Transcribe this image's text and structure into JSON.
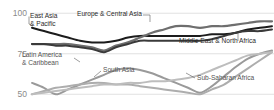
{
  "chart_data": {
    "type": "line",
    "title": "",
    "subtitle": "",
    "xlabel": "",
    "ylabel": "",
    "ylim": [
      44,
      102
    ],
    "yticks": [
      100,
      75,
      50
    ],
    "ytick_labels": [
      "100",
      "75",
      "50"
    ],
    "grid": true,
    "grid_axis": "y",
    "legend": "inline-callouts",
    "x": [
      0,
      1,
      2,
      3,
      4,
      5,
      6,
      7,
      8,
      9,
      10,
      11,
      12,
      13,
      14,
      15,
      16,
      17,
      18,
      19,
      20
    ],
    "series": [
      {
        "name": "East Asia & Pacific",
        "color": "#1c1c1c",
        "width": 2.0,
        "values": [
          91,
          89,
          87,
          85,
          83,
          82,
          82,
          83,
          85,
          86,
          86,
          86,
          86,
          86,
          86,
          87,
          87,
          88,
          90,
          91,
          92
        ]
      },
      {
        "name": "Europe & Central Asia",
        "color": "#6e6e6e",
        "width": 2.2,
        "values": [
          81,
          81,
          81,
          81,
          80,
          79,
          77,
          80,
          82,
          85,
          88,
          90,
          92,
          92,
          91,
          92,
          92,
          93,
          94,
          95,
          95
        ]
      },
      {
        "name": "Middle East & North Africa",
        "color": "#3a3a3a",
        "width": 2.0,
        "values": [
          81,
          81,
          80,
          80,
          79,
          78,
          76,
          79,
          81,
          83,
          83,
          83,
          83,
          83,
          83,
          84,
          86,
          88,
          89,
          89,
          90
        ]
      },
      {
        "name": "Latin America & Caribbean",
        "color": "#9a9a9a",
        "width": 2.0,
        "values": [
          57,
          54,
          50,
          53,
          56,
          59,
          62,
          65,
          66,
          65,
          63,
          60,
          57,
          54,
          51,
          55,
          61,
          67,
          72,
          75,
          77
        ]
      },
      {
        "name": "South Asia",
        "color": "#adadad",
        "width": 2.0,
        "values": [
          50,
          52,
          54,
          55,
          56,
          57,
          57,
          56,
          56,
          55,
          54,
          53,
          52,
          51,
          50,
          53,
          56,
          61,
          66,
          71,
          76
        ]
      },
      {
        "name": "Sub-Saharan Africa",
        "color": "#bdbdbd",
        "width": 2.0,
        "values": [
          50,
          51,
          52,
          53,
          54,
          55,
          56,
          56,
          57,
          57,
          58,
          58,
          59,
          60,
          62,
          65,
          68,
          71,
          74,
          75,
          76
        ]
      }
    ],
    "callouts": [
      {
        "label": "East Asia",
        "label2": "& Pacific",
        "x": 30,
        "y": 18
      },
      {
        "label": "Europe & Central Asia",
        "label2": "",
        "x": 77,
        "y": 16
      },
      {
        "label": "Middle East & North Africa",
        "label2": "",
        "x": 179,
        "y": 43
      },
      {
        "label": "Latin America",
        "label2": "& Caribbean",
        "x": 22,
        "y": 57
      },
      {
        "label": "South Asia",
        "label2": "",
        "x": 103,
        "y": 72
      },
      {
        "label": "Sub-Saharan Africa",
        "label2": "",
        "x": 197,
        "y": 80
      }
    ]
  }
}
